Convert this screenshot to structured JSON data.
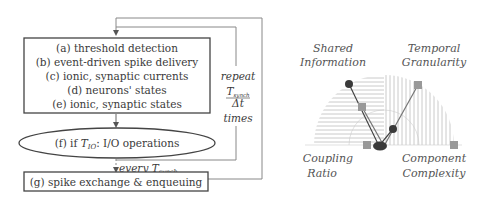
{
  "flowchart": {
    "main_box_lines": [
      "(a) threshold detection",
      "(b) event-driven spike delivery",
      "(c) ionic, synaptic currents",
      "(d) neurons' states",
      "(e) ionic, synaptic states"
    ],
    "ellipse_prefix": "(f) if ",
    "ellipse_T": "T",
    "ellipse_sub": "IO",
    "ellipse_suffix": ": I/O operations",
    "repeat_label": "repeat",
    "frac_num_T": "T",
    "frac_num_sub": "synch",
    "frac_den": "Δt",
    "times_label": "times",
    "every_label": "every ",
    "every_T": "T",
    "every_sub": "synch",
    "bottom_box": "(g) spike exchange & enqueuing"
  },
  "radar": {
    "labels": {
      "top_left_1": "Shared",
      "top_left_2": "Information",
      "top_right_1": "Temporal",
      "top_right_2": "Granularity",
      "bottom_left_1": "Coupling",
      "bottom_left_2": "Ratio",
      "bottom_right_1": "Component",
      "bottom_right_2": "Complexity"
    },
    "colors": {
      "circle_series": "#3a3a3a",
      "square_series": "#999999",
      "hatch": "#bdbdbd"
    }
  }
}
